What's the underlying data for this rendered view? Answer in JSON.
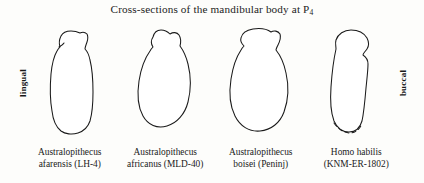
{
  "figure": {
    "title_prefix": "Cross-sections of the mandibular body at P",
    "title_subscript": "4",
    "title_full": "Cross-sections of the mandibular body at P4",
    "orientation_labels": {
      "left": "lingual",
      "right": "buccal"
    },
    "colors": {
      "background": "#fdfdfb",
      "outline_stroke": "#1a1a1a",
      "outline_fill": "#ffffff",
      "text": "#1c1c1c"
    },
    "specimens": [
      {
        "genus_species": "Australopithecus",
        "species_epithet_and_specimen": "afarensis (LH-4)",
        "taxon": "Australopithecus afarensis",
        "specimen_number": "LH-4",
        "shape_note": "narrow elongated vertical cross-section, tall and slender with flat crown and small lateral notches",
        "base_dashed": false
      },
      {
        "genus_species": "Australopithecus",
        "species_epithet_and_specimen": "africanus (MLD-40)",
        "taxon": "Australopithecus africanus",
        "specimen_number": "MLD-40",
        "shape_note": "broad pear or teardrop shaped cross-section widening toward the base",
        "base_dashed": false
      },
      {
        "genus_species": "Australopithecus",
        "species_epithet_and_specimen": "boisei (Peninj)",
        "taxon": "Australopithecus boisei",
        "specimen_number": "Peninj",
        "shape_note": "widest and most robust cross-section, deep and thick corpus",
        "base_dashed": false
      },
      {
        "genus_species": "Homo habilis",
        "species_epithet_and_specimen": "(KNM-ER-1802)",
        "taxon": "Homo habilis",
        "specimen_number": "KNM-ER-1802",
        "shape_note": "narrow elongated cross-section with reconstructed base drawn as a dashed line",
        "base_dashed": true
      }
    ]
  }
}
